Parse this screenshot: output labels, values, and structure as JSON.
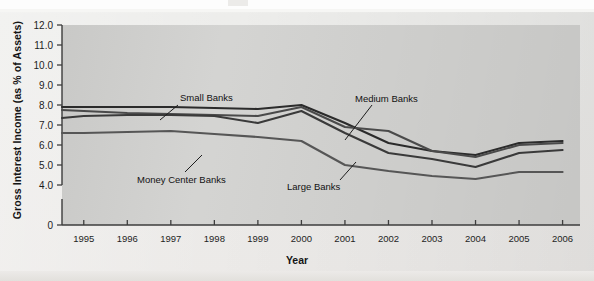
{
  "axes": {
    "y_title": "Gross Interest Income (as % of Assets)",
    "x_title": "Year",
    "y_ticks": [
      "12.0",
      "11.0",
      "10.0",
      "9.0",
      "8.0",
      "7.0",
      "6.0",
      "5.0",
      "4.0",
      "0"
    ],
    "x_ticks": [
      "1995",
      "1996",
      "1997",
      "1998",
      "1999",
      "2000",
      "2001",
      "2002",
      "2003",
      "2004",
      "2005",
      "2006"
    ]
  },
  "annotations": {
    "small_banks": "Small Banks",
    "money_center_banks": "Money Center Banks",
    "medium_banks": "Medium Banks",
    "large_banks": "Large Banks"
  },
  "colors": {
    "plot_background": "#d2d2d0",
    "page_background": "#eceae8",
    "line_small": "#2b2b2b",
    "line_medium": "#4a4a4a",
    "line_large": "#3a3a3a",
    "line_money": "#565656",
    "axis": "#3d3d3d"
  },
  "chart_data": {
    "type": "line",
    "title": "",
    "xlabel": "Year",
    "ylabel": "Gross Interest Income (as % of Assets)",
    "x": [
      1994.5,
      1995,
      1996,
      1997,
      1998,
      1999,
      2000,
      2001,
      2002,
      2003,
      2004,
      2005,
      2006
    ],
    "xlim": [
      1994.5,
      2006.4
    ],
    "ylim": [
      4.0,
      12.0
    ],
    "ytick_values": [
      12.0,
      11.0,
      10.0,
      9.0,
      8.0,
      7.0,
      6.0,
      5.0,
      4.0
    ],
    "y_axis_break_to_zero": true,
    "grid": false,
    "legend": "inline-annotations",
    "series": [
      {
        "name": "Small Banks",
        "color": "#2b2b2b",
        "values": [
          7.9,
          7.9,
          7.9,
          7.9,
          7.85,
          7.8,
          8.0,
          7.1,
          6.1,
          5.7,
          5.5,
          6.1,
          6.2
        ]
      },
      {
        "name": "Medium Banks",
        "color": "#4a4a4a",
        "values": [
          7.75,
          7.7,
          7.6,
          7.55,
          7.5,
          7.45,
          7.9,
          6.9,
          6.7,
          5.7,
          5.4,
          6.0,
          6.1
        ]
      },
      {
        "name": "Large Banks",
        "color": "#3a3a3a",
        "values": [
          7.35,
          7.45,
          7.5,
          7.5,
          7.45,
          7.1,
          7.7,
          6.6,
          5.6,
          5.3,
          4.9,
          5.6,
          5.75
        ]
      },
      {
        "name": "Money Center Banks",
        "color": "#565656",
        "values": [
          6.6,
          6.6,
          6.65,
          6.7,
          6.55,
          6.4,
          6.2,
          5.0,
          4.7,
          4.45,
          4.3,
          4.65,
          4.65
        ]
      }
    ]
  }
}
